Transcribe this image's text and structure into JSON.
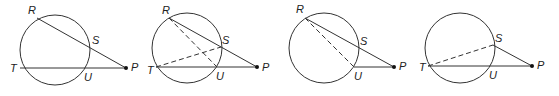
{
  "diagrams": [
    {
      "id": "figure-1",
      "labels": {
        "R": "R",
        "S": "S",
        "T": "T",
        "U": "U",
        "P": "P"
      },
      "circle": {
        "cx": 55,
        "cy": 50,
        "r": 35
      },
      "points": {
        "R": [
          37,
          18
        ],
        "S": [
          89,
          47
        ],
        "T": [
          20,
          68
        ],
        "U": [
          85,
          68
        ],
        "P": [
          126,
          68
        ]
      },
      "solid_segments": [
        [
          "R",
          "P"
        ],
        [
          "T",
          "P"
        ]
      ],
      "dashed_segments": []
    },
    {
      "id": "figure-2",
      "labels": {
        "R": "R",
        "S": "S",
        "T": "T",
        "U": "U",
        "P": "P"
      },
      "circle": {
        "cx": 187,
        "cy": 48,
        "r": 35
      },
      "points": {
        "R": [
          169,
          18
        ],
        "S": [
          221,
          47
        ],
        "T": [
          156,
          67
        ],
        "U": [
          217,
          67
        ],
        "P": [
          257,
          67
        ]
      },
      "solid_segments": [
        [
          "R",
          "P"
        ],
        [
          "T",
          "P"
        ]
      ],
      "dashed_segments": [
        [
          "R",
          "U"
        ],
        [
          "T",
          "S"
        ]
      ]
    },
    {
      "id": "figure-3",
      "labels": {
        "R": "R",
        "S": "S",
        "U": "U",
        "P": "P"
      },
      "circle": {
        "cx": 324,
        "cy": 48,
        "r": 35
      },
      "points": {
        "R": [
          305,
          18
        ],
        "S": [
          358,
          47
        ],
        "U": [
          354,
          67
        ],
        "P": [
          394,
          67
        ]
      },
      "solid_segments": [
        [
          "R",
          "P"
        ],
        [
          "U",
          "P"
        ]
      ],
      "dashed_segments": [
        [
          "R",
          "U"
        ]
      ]
    },
    {
      "id": "figure-4",
      "labels": {
        "S": "S",
        "T": "T",
        "U": "U",
        "P": "P"
      },
      "circle": {
        "cx": 460,
        "cy": 48,
        "r": 35
      },
      "points": {
        "S": [
          493,
          45
        ],
        "T": [
          428,
          66
        ],
        "U": [
          490,
          66
        ],
        "P": [
          532,
          66
        ]
      },
      "solid_segments": [
        [
          "S",
          "P"
        ],
        [
          "T",
          "P"
        ]
      ],
      "dashed_segments": [
        [
          "T",
          "S"
        ]
      ]
    }
  ]
}
